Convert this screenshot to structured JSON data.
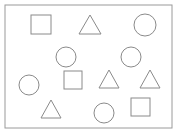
{
  "figure": {
    "background_color": "#ffffff",
    "stroke_color": "#8a8a8a",
    "frame_stroke_color": "#9a9a9a",
    "stroke_width": 1,
    "width": 180,
    "height": 136,
    "frame": {
      "name": "outer-frame",
      "x": 5,
      "y": 5,
      "width": 167,
      "height": 123
    },
    "shape_counts": {
      "square": 3,
      "triangle": 4,
      "circle": 5,
      "total": 12
    },
    "shapes": [
      {
        "id": "square-1",
        "type": "square",
        "label": "square",
        "cx": 41,
        "cy": 25,
        "size": 20,
        "x": 31,
        "y": 15,
        "width": 20,
        "height": 19
      },
      {
        "id": "triangle-1",
        "type": "triangle",
        "label": "triangle",
        "cx": 90,
        "cy": 25,
        "size": 22,
        "x": 79,
        "y": 15,
        "width": 22,
        "height": 19,
        "points": "90,15 101,34 79,34"
      },
      {
        "id": "circle-1",
        "type": "circle",
        "label": "circle",
        "cx": 145,
        "cy": 25,
        "r": 11
      },
      {
        "id": "circle-2",
        "type": "circle",
        "label": "circle",
        "cx": 66,
        "cy": 57,
        "r": 10
      },
      {
        "id": "circle-3",
        "type": "circle",
        "label": "circle",
        "cx": 131,
        "cy": 57,
        "r": 10
      },
      {
        "id": "square-2",
        "type": "square",
        "label": "square",
        "cx": 73,
        "cy": 80,
        "size": 18,
        "x": 64,
        "y": 71,
        "width": 18,
        "height": 18
      },
      {
        "id": "triangle-2",
        "type": "triangle",
        "label": "triangle",
        "cx": 109,
        "cy": 80,
        "size": 21,
        "x": 99,
        "y": 70,
        "width": 21,
        "height": 18,
        "points": "109,70 119,88 99,88"
      },
      {
        "id": "triangle-3",
        "type": "triangle",
        "label": "triangle",
        "cx": 150,
        "cy": 80,
        "size": 21,
        "x": 140,
        "y": 70,
        "width": 21,
        "height": 18,
        "points": "150,70 160,88 140,88"
      },
      {
        "id": "circle-4",
        "type": "circle",
        "label": "circle",
        "cx": 29,
        "cy": 85,
        "r": 10
      },
      {
        "id": "triangle-4",
        "type": "triangle",
        "label": "triangle",
        "cx": 51,
        "cy": 110,
        "size": 21,
        "x": 41,
        "y": 100,
        "width": 21,
        "height": 18,
        "points": "51,100 61,118 41,118"
      },
      {
        "id": "circle-5",
        "type": "circle",
        "label": "circle",
        "cx": 104,
        "cy": 113,
        "r": 10
      },
      {
        "id": "square-3",
        "type": "square",
        "label": "square",
        "cx": 140,
        "cy": 107,
        "size": 19,
        "x": 131,
        "y": 98,
        "width": 19,
        "height": 18
      }
    ]
  }
}
